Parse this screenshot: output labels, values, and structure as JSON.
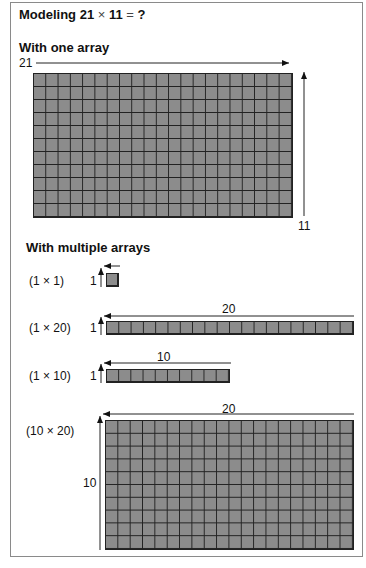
{
  "title": {
    "prefix": "Modeling 21",
    "op": "×",
    "mid": "11",
    "eq": "=",
    "suffix": "?"
  },
  "one_array": {
    "heading": "With one array",
    "width_label": "21",
    "height_label": "11",
    "rows": 11,
    "cols": 21
  },
  "multiple_arrays": {
    "heading": "With multiple arrays",
    "arrays": [
      {
        "label": "(1 × 1)",
        "rows": 1,
        "cols": 1,
        "side_label": "1",
        "top_label": ""
      },
      {
        "label": "(1 × 20)",
        "rows": 1,
        "cols": 20,
        "side_label": "1",
        "top_label": "20"
      },
      {
        "label": "(1 × 10)",
        "rows": 1,
        "cols": 10,
        "side_label": "1",
        "top_label": "10"
      },
      {
        "label": "(10 × 20)",
        "rows": 10,
        "cols": 20,
        "side_label": "10",
        "top_label": "20"
      }
    ]
  },
  "colors": {
    "cell_fill": "#8c8c8c",
    "grid_line": "#222222",
    "frame": "#8a8a8a"
  }
}
